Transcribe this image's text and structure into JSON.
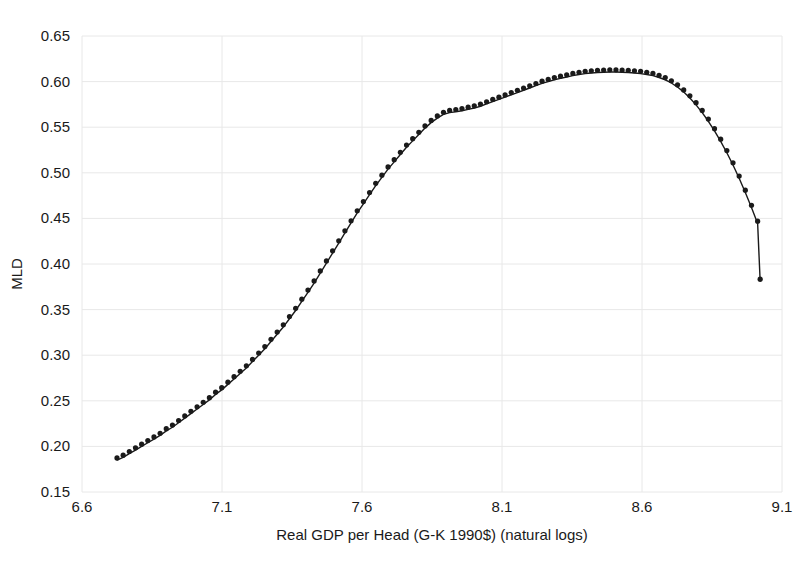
{
  "chart_data": {
    "type": "line",
    "title": "",
    "subtitle": "",
    "xlabel": "Real GDP per Head (G-K 1990$) (natural logs)",
    "ylabel": "MLD",
    "xlim": [
      6.6,
      9.1
    ],
    "ylim": [
      0.15,
      0.65
    ],
    "xticks": [
      "6.6",
      "7.1",
      "7.6",
      "8.1",
      "8.6",
      "9.1"
    ],
    "xtick_values": [
      6.6,
      7.1,
      7.6,
      8.1,
      8.6,
      9.1
    ],
    "yticks": [
      "0.15",
      "0.20",
      "0.25",
      "0.30",
      "0.35",
      "0.40",
      "0.45",
      "0.50",
      "0.55",
      "0.60",
      "0.65"
    ],
    "ytick_values": [
      0.15,
      0.2,
      0.25,
      0.3,
      0.35,
      0.4,
      0.45,
      0.5,
      0.55,
      0.6,
      0.65
    ],
    "grid": true,
    "grid_color": "#e8e8e8",
    "legend": null,
    "legend_position": "none",
    "line_color": "#1a1a1a",
    "marker_color": "#1a1a1a",
    "marker_shape": "circle",
    "marker_size": 2.6,
    "line_width": 1.4,
    "annotations": [],
    "series": [
      {
        "name": "MLD",
        "x": [
          6.725,
          6.747,
          6.769,
          6.791,
          6.813,
          6.835,
          6.857,
          6.879,
          6.901,
          6.923,
          6.945,
          6.967,
          6.989,
          7.011,
          7.033,
          7.055,
          7.077,
          7.099,
          7.121,
          7.143,
          7.165,
          7.187,
          7.209,
          7.231,
          7.253,
          7.275,
          7.297,
          7.319,
          7.341,
          7.363,
          7.385,
          7.407,
          7.429,
          7.451,
          7.473,
          7.495,
          7.517,
          7.539,
          7.561,
          7.583,
          7.605,
          7.627,
          7.649,
          7.671,
          7.693,
          7.715,
          7.737,
          7.759,
          7.781,
          7.803,
          7.825,
          7.847,
          7.869,
          7.891,
          7.913,
          7.935,
          7.957,
          7.979,
          8.001,
          8.023,
          8.045,
          8.067,
          8.089,
          8.111,
          8.133,
          8.155,
          8.177,
          8.199,
          8.221,
          8.243,
          8.265,
          8.287,
          8.309,
          8.331,
          8.353,
          8.375,
          8.397,
          8.419,
          8.441,
          8.463,
          8.485,
          8.507,
          8.529,
          8.551,
          8.573,
          8.595,
          8.617,
          8.639,
          8.661,
          8.683,
          8.705,
          8.727,
          8.749,
          8.771,
          8.793,
          8.815,
          8.837,
          8.859,
          8.881,
          8.903,
          8.925,
          8.947,
          8.969,
          8.991,
          9.013
        ],
        "y": [
          0.185,
          0.188,
          0.192,
          0.196,
          0.2,
          0.204,
          0.208,
          0.212,
          0.217,
          0.221,
          0.226,
          0.231,
          0.236,
          0.241,
          0.246,
          0.251,
          0.257,
          0.262,
          0.268,
          0.274,
          0.28,
          0.286,
          0.293,
          0.3,
          0.307,
          0.315,
          0.323,
          0.331,
          0.34,
          0.349,
          0.359,
          0.369,
          0.379,
          0.39,
          0.401,
          0.412,
          0.423,
          0.434,
          0.445,
          0.456,
          0.466,
          0.476,
          0.486,
          0.495,
          0.504,
          0.512,
          0.52,
          0.528,
          0.535,
          0.542,
          0.549,
          0.555,
          0.56,
          0.564,
          0.566,
          0.567,
          0.568,
          0.5695,
          0.571,
          0.573,
          0.5755,
          0.578,
          0.5805,
          0.583,
          0.5855,
          0.588,
          0.5905,
          0.593,
          0.5955,
          0.598,
          0.6,
          0.602,
          0.6035,
          0.605,
          0.6065,
          0.6078,
          0.6088,
          0.6095,
          0.61,
          0.6103,
          0.6105,
          0.6105,
          0.6103,
          0.61,
          0.6095,
          0.6088,
          0.6078,
          0.6065,
          0.6045,
          0.602,
          0.5985,
          0.594,
          0.5885,
          0.582,
          0.5745,
          0.566,
          0.5565,
          0.546,
          0.5345,
          0.522,
          0.5085,
          0.494,
          0.4785,
          0.462,
          0.4445
        ],
        "x_tail": [
          9.013,
          9.018,
          9.022
        ],
        "y_tail": [
          0.4445,
          0.41,
          0.381
        ]
      }
    ],
    "full_x": [
      6.725,
      6.747,
      6.769,
      6.791,
      6.813,
      6.835,
      6.857,
      6.879,
      6.901,
      6.923,
      6.945,
      6.967,
      6.989,
      7.011,
      7.033,
      7.055,
      7.077,
      7.099,
      7.121,
      7.143,
      7.165,
      7.187,
      7.209,
      7.231,
      7.253,
      7.275,
      7.297,
      7.319,
      7.341,
      7.363,
      7.385,
      7.407,
      7.429,
      7.451,
      7.473,
      7.495,
      7.517,
      7.539,
      7.561,
      7.583,
      7.605,
      7.627,
      7.649,
      7.671,
      7.693,
      7.715,
      7.737,
      7.759,
      7.781,
      7.803,
      7.825,
      7.847,
      7.869,
      7.891,
      7.913,
      7.935,
      7.957,
      7.979,
      8.001,
      8.023,
      8.045,
      8.067,
      8.089,
      8.111,
      8.133,
      8.155,
      8.177,
      8.199,
      8.221,
      8.243,
      8.265,
      8.287,
      8.309,
      8.331,
      8.353,
      8.375,
      8.397,
      8.419,
      8.441,
      8.463,
      8.485,
      8.507,
      8.529,
      8.551,
      8.573,
      8.595,
      8.617,
      8.639,
      8.661,
      8.683,
      8.705,
      8.727,
      8.749,
      8.771,
      8.793,
      8.815,
      8.837,
      8.859,
      8.881,
      8.903,
      8.925,
      8.947,
      8.969,
      8.991,
      9.013,
      9.022
    ],
    "full_y": [
      0.185,
      0.188,
      0.192,
      0.196,
      0.2,
      0.204,
      0.208,
      0.212,
      0.217,
      0.221,
      0.226,
      0.231,
      0.236,
      0.241,
      0.246,
      0.251,
      0.257,
      0.262,
      0.268,
      0.274,
      0.28,
      0.286,
      0.293,
      0.3,
      0.307,
      0.315,
      0.323,
      0.331,
      0.34,
      0.349,
      0.359,
      0.369,
      0.379,
      0.39,
      0.401,
      0.412,
      0.423,
      0.434,
      0.445,
      0.456,
      0.466,
      0.476,
      0.486,
      0.495,
      0.504,
      0.512,
      0.52,
      0.528,
      0.535,
      0.542,
      0.549,
      0.555,
      0.56,
      0.564,
      0.566,
      0.567,
      0.568,
      0.5695,
      0.571,
      0.573,
      0.5755,
      0.578,
      0.5805,
      0.583,
      0.5855,
      0.588,
      0.5905,
      0.593,
      0.5955,
      0.598,
      0.6,
      0.602,
      0.6035,
      0.605,
      0.6065,
      0.6078,
      0.6088,
      0.6095,
      0.61,
      0.6103,
      0.6105,
      0.6105,
      0.6103,
      0.61,
      0.6095,
      0.6088,
      0.6078,
      0.6065,
      0.6045,
      0.602,
      0.5985,
      0.594,
      0.5885,
      0.582,
      0.5745,
      0.566,
      0.5565,
      0.546,
      0.5345,
      0.522,
      0.5085,
      0.494,
      0.4785,
      0.462,
      0.4445,
      0.381
    ]
  },
  "axes": {
    "y_title": "MLD",
    "x_title": "Real GDP per Head (G-K 1990$) (natural logs)"
  }
}
